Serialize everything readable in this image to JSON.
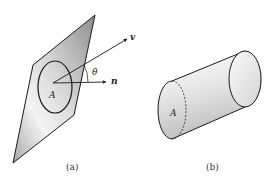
{
  "figure_a": {
    "caption": "(a)",
    "labels": {
      "area": "A",
      "velocity": "v",
      "normal": "n",
      "angle": "θ"
    }
  },
  "figure_b": {
    "caption": "(b)",
    "labels": {
      "area": "A"
    }
  },
  "colors": {
    "line": "#1a1a1a",
    "plane_fill_dark": "#9a9a9a",
    "plane_fill_light": "#f2f2f2",
    "cylinder_fill_dark": "#c4c4c4",
    "cylinder_fill_light": "#f6f6f6"
  }
}
